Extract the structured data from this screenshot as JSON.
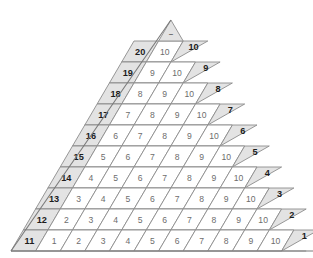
{
  "figure": {
    "name": "number-triangle-grid",
    "apex_mark": "–",
    "colors": {
      "shaded": "#e3e3e3",
      "white": "#ffffff",
      "stroke": "#8c8c8c",
      "label_dark": "#1c1c1c",
      "label_light": "#6d6d6d"
    },
    "rows": [
      {
        "head": "20",
        "cells": [
          "10"
        ],
        "edge": "10"
      },
      {
        "head": "19",
        "cells": [
          "9",
          "10"
        ],
        "edge": "9"
      },
      {
        "head": "18",
        "cells": [
          "8",
          "9",
          "10"
        ],
        "edge": "8"
      },
      {
        "head": "17",
        "cells": [
          "7",
          "8",
          "9",
          "10"
        ],
        "edge": "7"
      },
      {
        "head": "16",
        "cells": [
          "6",
          "7",
          "8",
          "9",
          "10"
        ],
        "edge": "6"
      },
      {
        "head": "15",
        "cells": [
          "5",
          "6",
          "7",
          "8",
          "9",
          "10"
        ],
        "edge": "5"
      },
      {
        "head": "14",
        "cells": [
          "4",
          "5",
          "6",
          "7",
          "8",
          "9",
          "10"
        ],
        "edge": "4"
      },
      {
        "head": "13",
        "cells": [
          "3",
          "4",
          "5",
          "6",
          "7",
          "8",
          "9",
          "10"
        ],
        "edge": "3"
      },
      {
        "head": "12",
        "cells": [
          "2",
          "3",
          "4",
          "5",
          "6",
          "7",
          "8",
          "9",
          "10"
        ],
        "edge": "2"
      },
      {
        "head": "11",
        "cells": [
          "1",
          "2",
          "3",
          "4",
          "5",
          "6",
          "7",
          "8",
          "9",
          "10"
        ],
        "edge": "1"
      }
    ]
  }
}
